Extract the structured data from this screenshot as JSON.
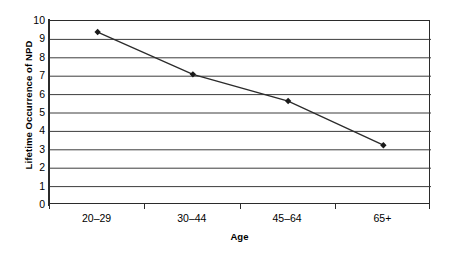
{
  "chart_data": {
    "type": "line",
    "title": "",
    "subtitle": "",
    "xlabel": "Age",
    "ylabel": "Lifetime Occurrence of NPD",
    "categories": [
      "20–29",
      "30–44",
      "45–64",
      "65+"
    ],
    "values": [
      9.4,
      7.1,
      5.65,
      3.25
    ],
    "series": [
      {
        "name": "Lifetime Occurrence of NPD",
        "values": [
          9.4,
          7.1,
          5.65,
          3.25
        ]
      }
    ],
    "ylim": [
      0,
      10
    ],
    "y_tick_step": 1,
    "y_ticks": [
      "10",
      "9",
      "8",
      "7",
      "6",
      "5",
      "4",
      "3",
      "2",
      "1",
      "0"
    ],
    "grid": "horizontal",
    "legend": "none",
    "marker": "diamond",
    "line_color": "#2b2b2b",
    "marker_color": "#1a1a1a",
    "grid_color": "#3c3c3c",
    "axis_color": "#2b2b2b",
    "plot_background": "#ffffff"
  },
  "axes": {
    "y_title": "Lifetime Occurrence of NPD",
    "x_title": "Age"
  }
}
